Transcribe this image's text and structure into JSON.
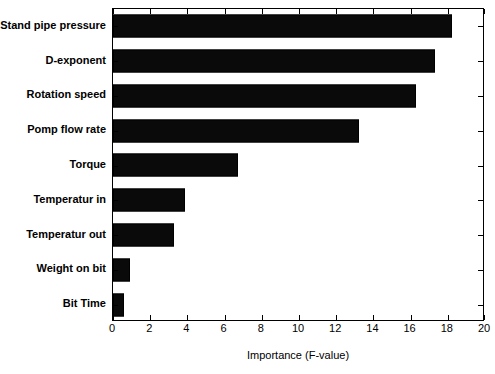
{
  "chart_data": {
    "type": "bar",
    "orientation": "horizontal",
    "title": "",
    "xlabel": "Importance (F-value)",
    "ylabel": "",
    "xlim": [
      0,
      20
    ],
    "xticks": [
      0,
      2,
      4,
      6,
      8,
      10,
      12,
      14,
      16,
      18,
      20
    ],
    "xtick_labels": [
      "0",
      "2",
      "4",
      "6",
      "8",
      "10",
      "12",
      "14",
      "16",
      "18",
      "20"
    ],
    "grid": false,
    "legend": null,
    "bar_color": "#0a0a0a",
    "background_color": "#ffffff",
    "axis_color": "#000000",
    "categories": [
      "Stand pipe pressure",
      "D-exponent",
      "Rotation speed",
      "Pomp flow rate",
      "Torque",
      "Temperatur in",
      "Temperatur out",
      "Weight on bit",
      "Bit Time"
    ],
    "values": [
      18.2,
      17.3,
      16.3,
      13.2,
      6.7,
      3.85,
      3.3,
      0.9,
      0.6
    ]
  }
}
